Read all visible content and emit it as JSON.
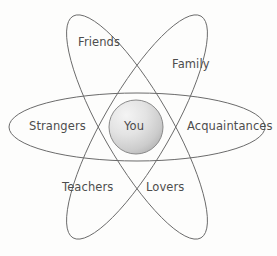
{
  "diagram": {
    "type": "atom-orbit-relationship-diagram",
    "title": "",
    "background_color": "#fdfdfc",
    "stroke_color": "#6b6b6b",
    "text_color": "#4d4d4d",
    "center": {
      "label": "You",
      "shape": "circle",
      "fill_gradient_light": "#f2f2f2",
      "fill_gradient_dark": "#b9b9b9",
      "stroke_color": "#8a8a8a",
      "cx": 136,
      "cy": 127,
      "r": 27
    },
    "orbits": [
      {
        "name": "horizontal-orbit",
        "cx": 137,
        "cy": 127,
        "rx": 128,
        "ry": 34,
        "rotation_deg": 0
      },
      {
        "name": "left-tilted-orbit",
        "cx": 137,
        "cy": 127,
        "rx": 128,
        "ry": 34,
        "rotation_deg": -60
      },
      {
        "name": "right-tilted-orbit",
        "cx": 137,
        "cy": 127,
        "rx": 128,
        "ry": 34,
        "rotation_deg": 60
      }
    ],
    "labels": [
      {
        "id": "friends",
        "text": "Friends"
      },
      {
        "id": "family",
        "text": "Family"
      },
      {
        "id": "strangers",
        "text": "Strangers"
      },
      {
        "id": "acquaintances",
        "text": "Acquaintances"
      },
      {
        "id": "teachers",
        "text": "Teachers"
      },
      {
        "id": "lovers",
        "text": "Lovers"
      }
    ]
  }
}
